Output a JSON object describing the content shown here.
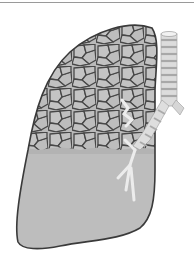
{
  "figure": {
    "regions": {
      "upper": "alveolar-cellular-pattern",
      "lower": "smooth-consolidated-area"
    },
    "airway": "trachea-and-bronchi",
    "colors": {
      "cell_fill": "#b8b8b8",
      "cell_border": "#4a4a4a",
      "lower_fill": "#bdbdbd",
      "outline": "#3c3c3c",
      "trachea_light": "#eeeeee",
      "trachea_dark": "#a9a9a9",
      "background": "#ffffff"
    }
  },
  "caption": {
    "visible": "cropped"
  }
}
